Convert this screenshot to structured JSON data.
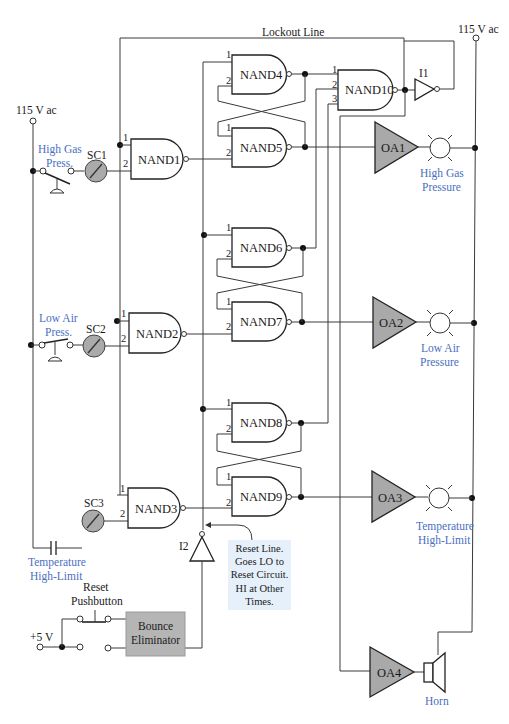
{
  "power": {
    "left_supply": "115 V ac",
    "right_supply": "115 V ac",
    "logic_supply": "+5 V"
  },
  "lockout_line_label": "Lockout Line",
  "sensors": [
    {
      "label_line1": "High Gas",
      "label_line2": "Press.",
      "conditioner": "SC1"
    },
    {
      "label_line1": "Low Air",
      "label_line2": "Press.",
      "conditioner": "SC2"
    },
    {
      "label_line1": "Temperature",
      "label_line2": "High-Limit",
      "conditioner": "SC3"
    }
  ],
  "gates": {
    "nand1": "NAND1",
    "nand2": "NAND2",
    "nand3": "NAND3",
    "nand4": "NAND4",
    "nand5": "NAND5",
    "nand6": "NAND6",
    "nand7": "NAND7",
    "nand8": "NAND8",
    "nand9": "NAND9",
    "nand10": "NAND10",
    "i1": "I1",
    "i2": "I2"
  },
  "pins": {
    "p1": "1",
    "p2": "2",
    "p3": "3"
  },
  "amplifiers": {
    "oa1": "OA1",
    "oa2": "OA2",
    "oa3": "OA3",
    "oa4": "OA4"
  },
  "indicators": [
    {
      "label_line1": "High Gas",
      "label_line2": "Pressure"
    },
    {
      "label_line1": "Low Air",
      "label_line2": "Pressure"
    },
    {
      "label_line1": "Temperature",
      "label_line2": "High-Limit"
    }
  ],
  "horn_label": "Horn",
  "reset": {
    "pushbutton_line1": "Reset",
    "pushbutton_line2": "Pushbutton",
    "bounce_line1": "Bounce",
    "bounce_line2": "Eliminator",
    "note_lines": [
      "Reset Line.",
      "Goes LO to",
      "Reset Circuit.",
      "HI at Other",
      "Times."
    ]
  },
  "colors": {
    "label_blue": "#4a6fbf",
    "amp_fill": "#a9a9a9",
    "bounce_fill": "#b5b5b5",
    "note_bg": "#e6f0fb"
  }
}
